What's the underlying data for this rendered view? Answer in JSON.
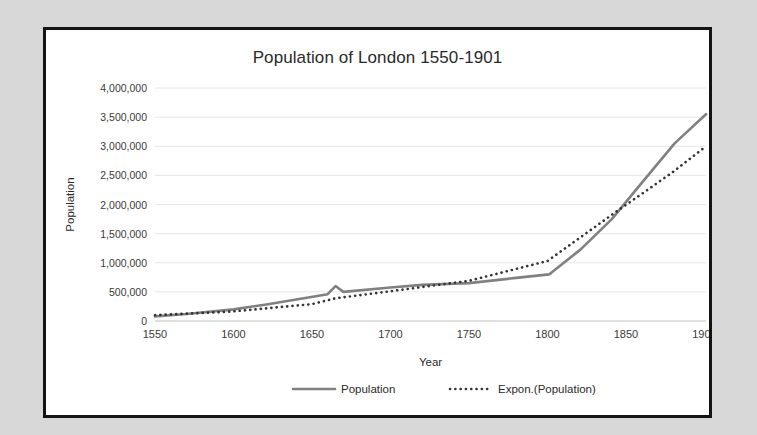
{
  "chart_data": {
    "type": "line",
    "title": "Population of London 1550-1901",
    "xlabel": "Year",
    "ylabel": "Population",
    "xlim": [
      1550,
      1901
    ],
    "ylim": [
      0,
      4000000
    ],
    "grid": true,
    "legend_position": "bottom",
    "xticks": [
      1550,
      1600,
      1650,
      1700,
      1750,
      1800,
      1850,
      1900
    ],
    "xtick_labels": [
      "1550",
      "1600",
      "1650",
      "1700",
      "1750",
      "1800",
      "1850",
      "1900"
    ],
    "yticks": [
      0,
      500000,
      1000000,
      1500000,
      2000000,
      2500000,
      3000000,
      3500000,
      4000000
    ],
    "ytick_labels": [
      "0",
      "500,000",
      "1,000,000",
      "1,500,000",
      "2,000,000",
      "2,500,000",
      "3,000,000",
      "3,500,000",
      "4,000,000"
    ],
    "series": [
      {
        "name": "Population",
        "style": "solid",
        "color": "#808080",
        "x": [
          1550,
          1570,
          1600,
          1620,
          1640,
          1660,
          1665,
          1670,
          1700,
          1720,
          1750,
          1780,
          1801,
          1821,
          1841,
          1861,
          1881,
          1901
        ],
        "values": [
          80000,
          120000,
          200000,
          280000,
          370000,
          460000,
          600000,
          500000,
          575000,
          620000,
          650000,
          740000,
          800000,
          1225000,
          1750000,
          2400000,
          3050000,
          3550000
        ]
      },
      {
        "name": "Expon.(Population)",
        "style": "dotted",
        "color": "#333333",
        "x": [
          1550,
          1600,
          1650,
          1665,
          1700,
          1750,
          1800,
          1845,
          1860,
          1880,
          1901
        ],
        "values": [
          100000,
          165000,
          290000,
          390000,
          510000,
          690000,
          1030000,
          1900000,
          2180000,
          2560000,
          3000000
        ]
      }
    ],
    "legend": [
      {
        "label": "Population",
        "style": "solid",
        "color": "#808080"
      },
      {
        "label": "Expon.(Population)",
        "style": "dotted",
        "color": "#333333"
      }
    ]
  }
}
